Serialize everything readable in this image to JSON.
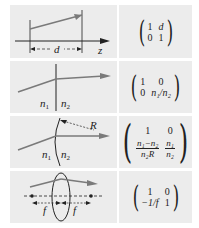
{
  "colors": {
    "cell_background": "#ececec",
    "gutter": "#ffffff",
    "ray": "#7a7a7a",
    "line": "#222222"
  },
  "rows": [
    {
      "name": "free-space-propagation",
      "diagram": {
        "distance_label": "d",
        "axis_label": "z"
      },
      "matrix": {
        "a": "1",
        "b": "d",
        "c": "0",
        "d": "1"
      }
    },
    {
      "name": "flat-interface-refraction",
      "diagram": {
        "n_left": "n",
        "n_left_sub": "1",
        "n_right": "n",
        "n_right_sub": "2"
      },
      "matrix": {
        "a": "1",
        "b": "0",
        "c": "0",
        "d": "n₁/n₂"
      }
    },
    {
      "name": "curved-interface-refraction",
      "diagram": {
        "radius_label": "R",
        "n_left": "n",
        "n_left_sub": "1",
        "n_right": "n",
        "n_right_sub": "2"
      },
      "matrix": {
        "a": "1",
        "b": "0",
        "c_num": "n₁−n₂",
        "c_den": "n₂R",
        "d_num": "n₁",
        "d_den": "n₂"
      }
    },
    {
      "name": "thin-lens",
      "diagram": {
        "focal_left": "f",
        "focal_right": "f"
      },
      "matrix": {
        "a": "1",
        "b": "0",
        "c": "−1/f",
        "d": "1"
      }
    }
  ]
}
